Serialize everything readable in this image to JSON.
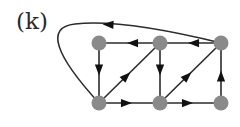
{
  "figure": {
    "label": "(k)",
    "colors": {
      "node": "#8a8a8a",
      "edge": "#2b2b2b",
      "arrow": "#111111"
    }
  },
  "graph": {
    "directed": true,
    "nodes": [
      {
        "id": "TL",
        "x": 99,
        "y": 43
      },
      {
        "id": "TM",
        "x": 160,
        "y": 43
      },
      {
        "id": "TR",
        "x": 221,
        "y": 43
      },
      {
        "id": "BL",
        "x": 99,
        "y": 103
      },
      {
        "id": "BM",
        "x": 160,
        "y": 103
      },
      {
        "id": "BR",
        "x": 221,
        "y": 103
      }
    ],
    "edges": [
      {
        "from": "TL",
        "to": "BL"
      },
      {
        "from": "TM",
        "to": "TL"
      },
      {
        "from": "TR",
        "to": "TM"
      },
      {
        "from": "TM",
        "to": "BM"
      },
      {
        "from": "BL",
        "to": "TM"
      },
      {
        "from": "BM",
        "to": "TR"
      },
      {
        "from": "BL",
        "to": "BM"
      },
      {
        "from": "BM",
        "to": "BR"
      },
      {
        "from": "BR",
        "to": "TR"
      },
      {
        "from": "TR",
        "to": "BL",
        "curved": true
      }
    ]
  }
}
